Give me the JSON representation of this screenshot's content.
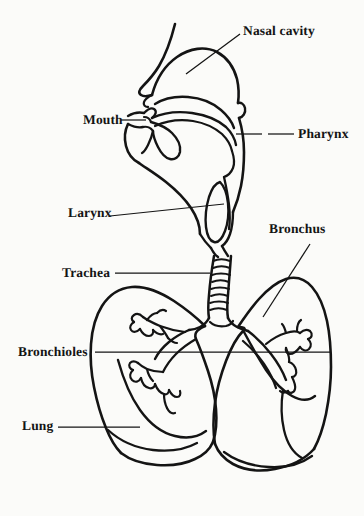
{
  "figure": {
    "style": "black-and-white line drawing",
    "background_color": "#fbfbf9",
    "ink_color": "#141414"
  },
  "labels": [
    {
      "id": "nasal-cavity",
      "text": "Nasal cavity"
    },
    {
      "id": "mouth",
      "text": "Mouth"
    },
    {
      "id": "pharynx",
      "text": "Pharynx"
    },
    {
      "id": "larynx",
      "text": "Larynx"
    },
    {
      "id": "bronchus",
      "text": "Bronchus"
    },
    {
      "id": "trachea",
      "text": "Trachea"
    },
    {
      "id": "bronchioles",
      "text": "Bronchioles"
    },
    {
      "id": "lung",
      "text": "Lung"
    }
  ]
}
